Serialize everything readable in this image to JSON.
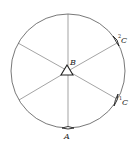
{
  "diagram": {
    "type": "circle with six radial spokes",
    "colors": {
      "stroke": "#555555",
      "text": "#222222",
      "background": "#ffffff"
    },
    "circle": {
      "cx": 68,
      "cy": 71,
      "r": 57
    },
    "center_marker": {
      "shape": "triangle",
      "label": "B"
    },
    "points": [
      {
        "id": "A",
        "label": "A",
        "position": "bottom"
      },
      {
        "id": "C1",
        "label": "C",
        "superscript": "1",
        "position": "lower-right"
      },
      {
        "id": "C2",
        "label": "C",
        "superscript": "2",
        "position": "upper-right"
      }
    ]
  }
}
